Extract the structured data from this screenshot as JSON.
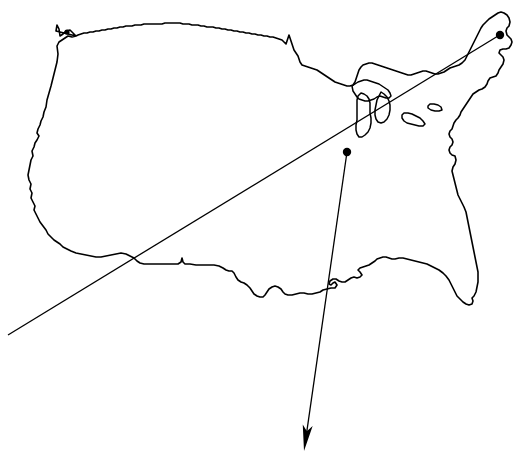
{
  "figure": {
    "kind": "outline-map",
    "region": "contiguous-united-states",
    "width": 532,
    "height": 464,
    "background_color": "#ffffff",
    "stroke_color": "#000000"
  },
  "markers": [
    {
      "name": "marker-northwest",
      "x": 67,
      "y": 32,
      "radius": 2.6,
      "color": "#000000"
    },
    {
      "name": "marker-northeast",
      "x": 500,
      "y": 35,
      "radius": 4.2,
      "color": "#000000"
    },
    {
      "name": "marker-midwest",
      "x": 347,
      "y": 152,
      "radius": 4.2,
      "color": "#000000"
    }
  ],
  "annotations": [
    {
      "name": "diagonal-line",
      "from_x": 8,
      "from_y": 335,
      "to_x": 498,
      "to_y": 36,
      "has_arrowhead": false
    },
    {
      "name": "arrow-line",
      "from_x": 347,
      "from_y": 152,
      "to_x": 304,
      "to_y": 451,
      "has_arrowhead": true
    }
  ],
  "lakes": [
    "lake-superior",
    "lake-michigan",
    "lake-huron",
    "lake-erie",
    "lake-ontario"
  ]
}
